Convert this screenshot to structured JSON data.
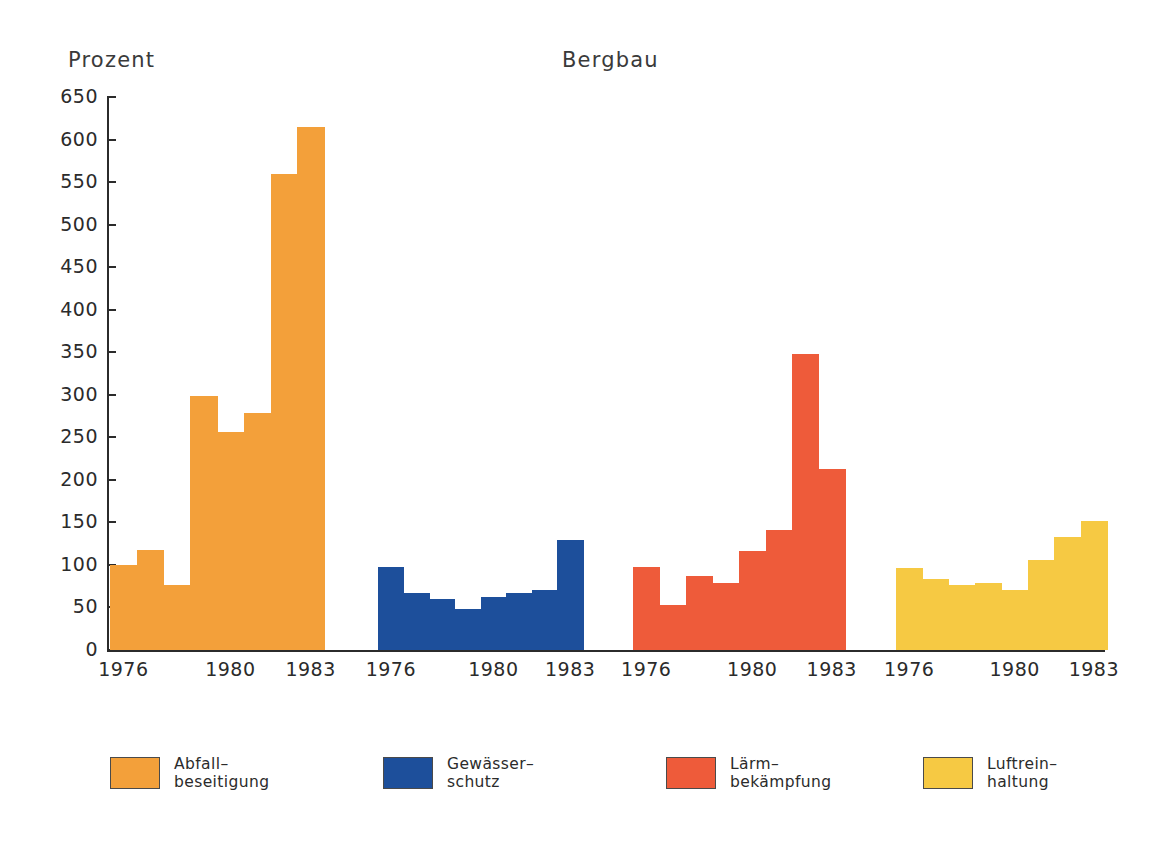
{
  "chart_title": "Bergbau",
  "y_axis_title": "Prozent",
  "colors": {
    "background": "#ffffff",
    "axis": "#2b2b2b",
    "text": "#2b2b2b",
    "abfallbeseitigung": "#F3A03A",
    "gewaesserschutz": "#1D4F9B",
    "laermbekaempfung": "#EE5B3A",
    "luftreinhaltung": "#F6C943"
  },
  "y_ticks": [
    0,
    50,
    100,
    150,
    200,
    250,
    300,
    350,
    400,
    450,
    500,
    550,
    600,
    650
  ],
  "x_tick_labels": [
    "1976",
    "1980",
    "1983"
  ],
  "legend": [
    {
      "label_line1": "Abfall–",
      "label_line2": "beseitigung",
      "color": "#F3A03A",
      "swatch": "legend-swatch-abfallbeseitigung"
    },
    {
      "label_line1": "Gewässer–",
      "label_line2": "schutz",
      "color": "#1D4F9B",
      "swatch": "legend-swatch-gewaesserschutz"
    },
    {
      "label_line1": "Lärm–",
      "label_line2": "bekämpfung",
      "color": "#EE5B3A",
      "swatch": "legend-swatch-laermbekaempfung"
    },
    {
      "label_line1": "Luftrein–",
      "label_line2": "haltung",
      "color": "#F6C943",
      "swatch": "legend-swatch-luftreinhaltung"
    }
  ],
  "chart_data": {
    "type": "bar",
    "title": "Bergbau",
    "xlabel": "",
    "ylabel": "Prozent",
    "ylim": [
      0,
      650
    ],
    "ytick_step": 50,
    "grid": false,
    "legend_position": "bottom",
    "categories": [
      "1976",
      "1977",
      "1978",
      "1979",
      "1980",
      "1981",
      "1982",
      "1983"
    ],
    "series": [
      {
        "name": "Abfall–beseitigung",
        "color": "#F3A03A",
        "values": [
          100,
          117,
          77,
          298,
          256,
          279,
          560,
          615
        ]
      },
      {
        "name": "Gewässer–schutz",
        "color": "#1D4F9B",
        "values": [
          98,
          67,
          60,
          48,
          62,
          67,
          71,
          129
        ]
      },
      {
        "name": "Lärm–bekämpfung",
        "color": "#EE5B3A",
        "values": [
          98,
          53,
          87,
          79,
          116,
          141,
          348,
          213
        ]
      },
      {
        "name": "Luftrein–haltung",
        "color": "#F6C943",
        "values": [
          96,
          84,
          76,
          79,
          70,
          106,
          133,
          152
        ]
      }
    ]
  }
}
